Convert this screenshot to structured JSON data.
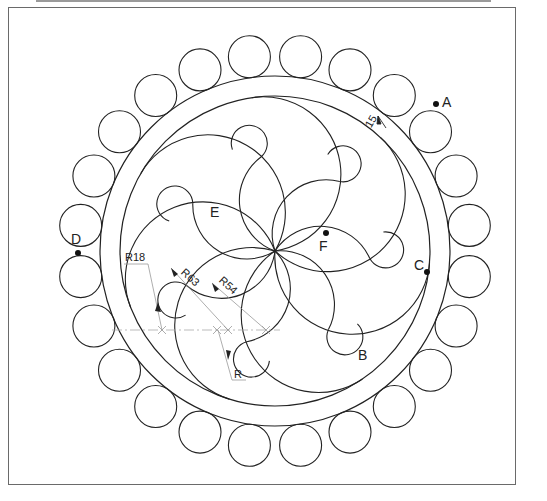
{
  "drawing": {
    "title": "Gear-like ornament with pinwheel petals",
    "center": [
      275,
      251
    ],
    "outer_ring_radius": 175,
    "inner_ring_radius": 155,
    "outer_circle_count": 24,
    "outer_circle_radius": 21,
    "petal_count": 7,
    "line_color": "#222222",
    "centerline_color": "#9a9a9a"
  },
  "points": {
    "A": {
      "label": "A",
      "x": 436,
      "y": 104
    },
    "B": {
      "label": "B",
      "x": 364,
      "y": 355
    },
    "C": {
      "label": "C",
      "x": 427,
      "y": 272
    },
    "D": {
      "label": "D",
      "x": 78,
      "y": 253
    },
    "E": {
      "label": "E",
      "x": 216,
      "y": 212
    },
    "F": {
      "label": "F",
      "x": 326,
      "y": 233
    }
  },
  "dimensions": {
    "ring_width": "15",
    "r_small": "R18",
    "r_outer_arc": "R63",
    "r_inner_arc": "R54",
    "r_unknown": "R"
  }
}
